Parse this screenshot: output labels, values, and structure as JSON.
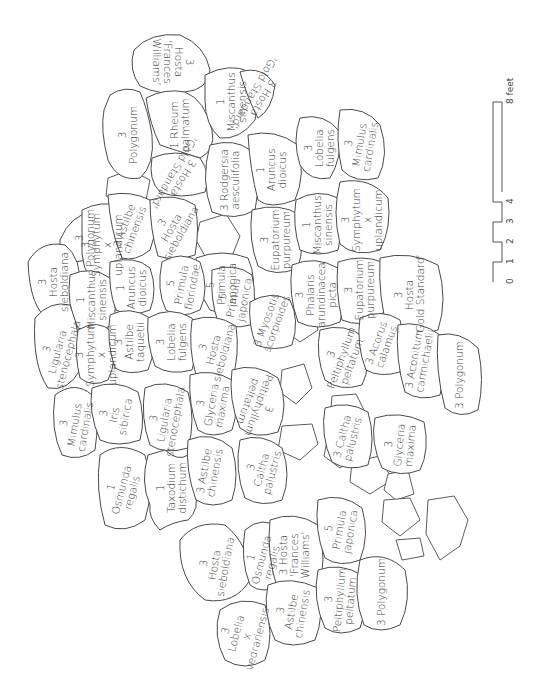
{
  "diagram": {
    "orientation": "rotated 90 degrees counter-clockwise",
    "scale_bar": {
      "ticks": [
        "0",
        "1",
        "2",
        "3",
        "4",
        "8 feet"
      ],
      "unit": "feet"
    },
    "beds": [
      {
        "id": "b1",
        "qty": "3",
        "name": "Hosta 'Frances Williams'",
        "lines": [
          "3",
          "Hosta",
          "'Frances",
          "Williams'"
        ]
      },
      {
        "id": "b2",
        "qty": "3",
        "name": "Polygonum",
        "lines": [
          "3",
          "Polygonum"
        ]
      },
      {
        "id": "b3",
        "qty": "1",
        "name": "Rheum palmatum",
        "lines": [
          "1 Rheum",
          "palmatum"
        ]
      },
      {
        "id": "b4",
        "qty": "1",
        "name": "Miscanthus sinensis",
        "lines": [
          "1",
          "Miscanthus",
          "sinensis"
        ]
      },
      {
        "id": "b5",
        "qty": "3",
        "name": "Hosta 'Gold Standard'",
        "lines": [
          "3 Hosta",
          "'Gold Standard'"
        ]
      },
      {
        "id": "b6",
        "qty": "3",
        "name": "Hosta 'Gold Standard'",
        "lines": [
          "3 Hosta",
          "'Gold Standard'"
        ]
      },
      {
        "id": "b7",
        "qty": "3",
        "name": "Rodgersia aesculifolia",
        "lines": [
          "3 Rodgersia",
          "aesculifolia"
        ]
      },
      {
        "id": "b8",
        "qty": "1",
        "name": "Aruncus dioicus",
        "lines": [
          "1",
          "Aruncus",
          "dioicus"
        ]
      },
      {
        "id": "b9",
        "qty": "3",
        "name": "Lobelia fulgens",
        "lines": [
          "3",
          "Lobelia",
          "fulgens"
        ]
      },
      {
        "id": "b10",
        "qty": "3",
        "name": "Mimulus cardinalis",
        "lines": [
          "3",
          "Mimulus",
          "cardinalis"
        ]
      },
      {
        "id": "b11",
        "qty": "3",
        "name": "Polygonum",
        "lines": [
          "3",
          "Polygonum"
        ]
      },
      {
        "id": "b12",
        "qty": "3",
        "name": "Symphytum x uplandicum",
        "lines": [
          "3",
          "Symphytum",
          "x",
          "uplandicum"
        ]
      },
      {
        "id": "b13",
        "qty": "3",
        "name": "Astilbe chinensis",
        "lines": [
          "3 Astilbe",
          "chinensis"
        ]
      },
      {
        "id": "b14",
        "qty": "3",
        "name": "Hosta sieboldiana",
        "lines": [
          "3",
          "Hosta",
          "sieboldiana"
        ]
      },
      {
        "id": "b15",
        "qty": "5",
        "name": "Primula japonica",
        "lines": [
          "5",
          "Primula",
          "japonica"
        ]
      },
      {
        "id": "b16",
        "qty": "3",
        "name": "Eupatorium purpureum",
        "lines": [
          "3",
          "Eupatorium",
          "purpureum"
        ]
      },
      {
        "id": "b17",
        "qty": "1",
        "name": "Miscanthus sinensis",
        "lines": [
          "1",
          "Miscanthus",
          "sinensis"
        ]
      },
      {
        "id": "b18",
        "qty": "3",
        "name": "Symphytum x uplandicum",
        "lines": [
          "3",
          "Symphytum",
          "x",
          "uplandicum"
        ]
      },
      {
        "id": "b19",
        "qty": "3",
        "name": "Hosta sieboldiana",
        "lines": [
          "3",
          "Hosta",
          "sieboldiana"
        ]
      },
      {
        "id": "b20",
        "qty": "1",
        "name": "Miscanthus sinensis",
        "lines": [
          "1",
          "Miscanthus",
          "sinensis"
        ]
      },
      {
        "id": "b21",
        "qty": "1",
        "name": "Aruncus dioicus",
        "lines": [
          "1",
          "Aruncus",
          "dioicus"
        ]
      },
      {
        "id": "b22",
        "qty": "5",
        "name": "Primula florindae",
        "lines": [
          "5",
          "Primula",
          "florindae"
        ]
      },
      {
        "id": "b23",
        "qty": "5",
        "name": "Primula japonica",
        "lines": [
          "5",
          "Primula",
          "japonica"
        ]
      },
      {
        "id": "b24",
        "qty": "3",
        "name": "Myosotis scorpioides",
        "lines": [
          "3 Myosotis",
          "scorpioides"
        ]
      },
      {
        "id": "b25",
        "qty": "3",
        "name": "Phalaris arundinacea picta",
        "lines": [
          "3",
          "Phalaris",
          "arundinacea",
          "picta"
        ]
      },
      {
        "id": "b26",
        "qty": "3",
        "name": "Eupatorium purpureum",
        "lines": [
          "3",
          "Eupatorium",
          "purpureum"
        ]
      },
      {
        "id": "b27",
        "qty": "3",
        "name": "Hosta 'Gold Standard'",
        "lines": [
          "3",
          "Hosta",
          "'Gold Standard'"
        ]
      },
      {
        "id": "b28",
        "qty": "3",
        "name": "Ligularia stenocephala",
        "lines": [
          "3",
          "Ligularia",
          "stenocephala"
        ]
      },
      {
        "id": "b29",
        "qty": "3",
        "name": "Symphytum x uplandicum",
        "lines": [
          "3",
          "Symphytum",
          "x",
          "uplandicum"
        ]
      },
      {
        "id": "b30",
        "qty": "3",
        "name": "Astilbe taquetii",
        "lines": [
          "3",
          "Astilbe",
          "taquetii"
        ]
      },
      {
        "id": "b31",
        "qty": "3",
        "name": "Lobelia fulgens",
        "lines": [
          "3",
          "Lobelia",
          "fulgens"
        ]
      },
      {
        "id": "b32",
        "qty": "3",
        "name": "Hosta sieboldiana",
        "lines": [
          "3",
          "Hosta",
          "sieboldiana"
        ]
      },
      {
        "id": "b33",
        "qty": "3",
        "name": "Peltiphyllum peltatum",
        "lines": [
          "3",
          "Peltiphyllum",
          "peltatum"
        ]
      },
      {
        "id": "b34",
        "qty": "3",
        "name": "Acorus calamus",
        "lines": [
          "3 Acorus",
          "calamus"
        ]
      },
      {
        "id": "b35",
        "qty": "3",
        "name": "Aconitum carmichaelii",
        "lines": [
          "3 Aconitum",
          "carmichaelii"
        ]
      },
      {
        "id": "b36",
        "qty": "3",
        "name": "Polygonum",
        "lines": [
          "3 Polygonum"
        ]
      },
      {
        "id": "b37",
        "qty": "3",
        "name": "Mimulus cardinalis",
        "lines": [
          "3",
          "Mimulus",
          "cardinalis"
        ]
      },
      {
        "id": "b38",
        "qty": "3",
        "name": "Iris sibirica",
        "lines": [
          "3",
          "Iris",
          "sibirica"
        ]
      },
      {
        "id": "b39",
        "qty": "3",
        "name": "Ligularia stenocephala",
        "lines": [
          "3",
          "Ligularia",
          "stenocephala"
        ]
      },
      {
        "id": "b40",
        "qty": "3",
        "name": "Glyceria maxima",
        "lines": [
          "3",
          "Glyceria",
          "maxima"
        ]
      },
      {
        "id": "b41",
        "qty": "3",
        "name": "Peltiphyllum peltatum",
        "lines": [
          "3",
          "Peltiphyllum",
          "peltatum"
        ]
      },
      {
        "id": "b42",
        "qty": "3",
        "name": "Caltha palustris",
        "lines": [
          "3 Caltha",
          "palustris"
        ]
      },
      {
        "id": "b43",
        "qty": "3",
        "name": "Glyceria maxima",
        "lines": [
          "3",
          "Glyceria",
          "maxima"
        ]
      },
      {
        "id": "b44",
        "qty": "1",
        "name": "Osmunda regalis",
        "lines": [
          "1",
          "Osmunda",
          "regalis"
        ]
      },
      {
        "id": "b45",
        "qty": "1",
        "name": "Taxodium distichum",
        "lines": [
          "1",
          "Taxodium",
          "distichum"
        ]
      },
      {
        "id": "b46",
        "qty": "3",
        "name": "Astilbe chinensis",
        "lines": [
          "3 Astilbe",
          "chinensis"
        ]
      },
      {
        "id": "b47",
        "qty": "3",
        "name": "Caltha palustris",
        "lines": [
          "3",
          "Caltha",
          "palustris"
        ]
      },
      {
        "id": "b48",
        "qty": "3",
        "name": "Hosta sieboldiana",
        "lines": [
          "3",
          "Hosta",
          "sieboldiana"
        ]
      },
      {
        "id": "b49",
        "qty": "1",
        "name": "Osmunda regalis",
        "lines": [
          "1",
          "Osmunda",
          "regalis"
        ]
      },
      {
        "id": "b50",
        "qty": "3",
        "name": "Hosta 'Frances Williams'",
        "lines": [
          "3 Hosta",
          "'Frances",
          "Williams'"
        ]
      },
      {
        "id": "b51",
        "qty": "5",
        "name": "Primula japonica",
        "lines": [
          "5",
          "Primula",
          "japonica"
        ]
      },
      {
        "id": "b52",
        "qty": "3",
        "name": "Lobelia x vedrariensis",
        "lines": [
          "3",
          "Lobelia",
          "x",
          "vedrariensis"
        ]
      },
      {
        "id": "b53",
        "qty": "3",
        "name": "Astilbe chinensis",
        "lines": [
          "3",
          "Astilbe",
          "chinensis"
        ]
      },
      {
        "id": "b54",
        "qty": "3",
        "name": "Peltiphyllum peltatum",
        "lines": [
          "3",
          "Peltiphyllum",
          "peltatum"
        ]
      },
      {
        "id": "b55",
        "qty": "3",
        "name": "Polygonum",
        "lines": [
          "3 Polygonum"
        ]
      }
    ]
  }
}
